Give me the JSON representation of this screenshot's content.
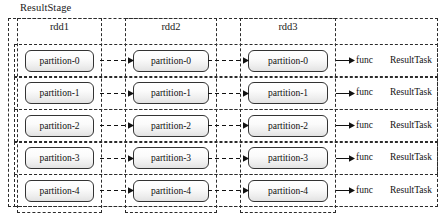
{
  "diagram": {
    "type": "spark-stage-dag",
    "stage_label": "ResultStage",
    "colors": {
      "dash_stroke": "#2b2b2b",
      "box_border": "#333333",
      "box_fill_top": "#ffffff",
      "box_fill_bottom": "#e2e2e2",
      "text": "#111111",
      "background": "#ffffff"
    },
    "columns": [
      {
        "label": "rdd1"
      },
      {
        "label": "rdd2"
      },
      {
        "label": "rdd3"
      }
    ],
    "rows": [
      {
        "partitions": [
          "partition-0",
          "partition-0",
          "partition-0"
        ],
        "func_label": "func",
        "task_label": "ResultTask"
      },
      {
        "partitions": [
          "partition-1",
          "partition-1",
          "partition-1"
        ],
        "func_label": "func",
        "task_label": "ResultTask"
      },
      {
        "partitions": [
          "partition-2",
          "partition-2",
          "partition-2"
        ],
        "func_label": "func",
        "task_label": "ResultTask"
      },
      {
        "partitions": [
          "partition-3",
          "partition-3",
          "partition-3"
        ],
        "func_label": "func",
        "task_label": "ResultTask"
      },
      {
        "partitions": [
          "partition-4",
          "partition-4",
          "partition-4"
        ],
        "func_label": "func",
        "task_label": "ResultTask"
      }
    ],
    "arrows": {
      "dashed_style": "dashed-with-solid-arrowhead",
      "solid_style": "solid-arrowhead"
    }
  }
}
